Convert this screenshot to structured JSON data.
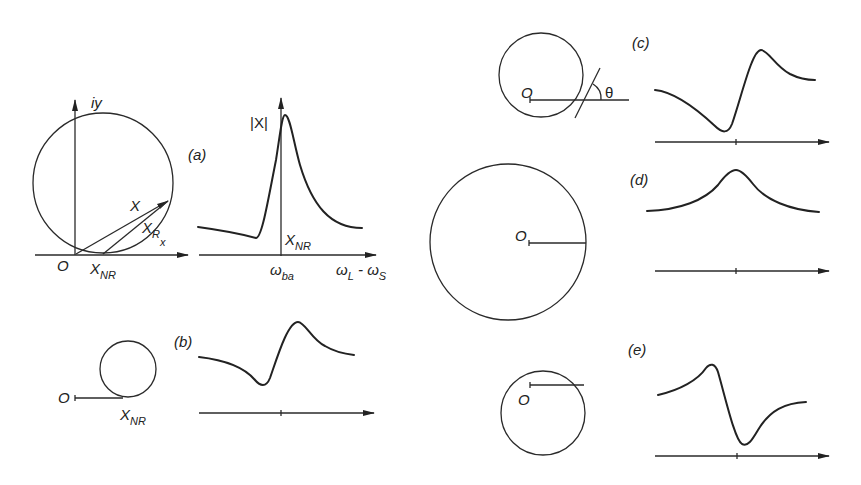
{
  "figure": {
    "panels": [
      {
        "id": "a",
        "label": "(a)",
        "circle_labels": {
          "origin": "O",
          "axis_y": "iy",
          "vector": "X",
          "resonant": "X",
          "resonant_sub": "R",
          "resonant_sub2": "x",
          "nonres": "X",
          "nonres_sub": "NR"
        },
        "plot_labels": {
          "y_axis": "|X|",
          "x_tick": "ω",
          "x_tick_sub": "ba",
          "x_axis": "ω",
          "x_axis_sub": "L",
          "x_axis_dash": " - ω",
          "x_axis_sub2": "S",
          "nonres": "X",
          "nonres_sub": "NR"
        }
      },
      {
        "id": "b",
        "label": "(b)",
        "circle_labels": {
          "origin": "O",
          "nonres": "X",
          "nonres_sub": "NR"
        }
      },
      {
        "id": "c",
        "label": "(c)",
        "circle_labels": {
          "origin": "O",
          "angle": "θ"
        }
      },
      {
        "id": "d",
        "label": "(d)",
        "circle_labels": {
          "origin": "O"
        }
      },
      {
        "id": "e",
        "label": "(e)",
        "circle_labels": {
          "origin": "O"
        }
      }
    ]
  },
  "colors": {
    "ink": "#222222",
    "background": "#ffffff"
  }
}
